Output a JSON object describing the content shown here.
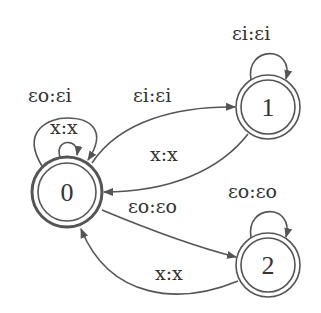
{
  "diagram": {
    "type": "finite-state-transducer",
    "colors": {
      "stroke": "#555555",
      "text": "#333333",
      "background": "#ffffff"
    },
    "nodes": [
      {
        "id": "0",
        "label": "0",
        "final": true,
        "initial": true
      },
      {
        "id": "1",
        "label": "1",
        "final": true
      },
      {
        "id": "2",
        "label": "2",
        "final": true
      }
    ],
    "edges": [
      {
        "from": "0",
        "to": "0",
        "label": "εo:εi"
      },
      {
        "from": "0",
        "to": "0",
        "label": "x:x"
      },
      {
        "from": "0",
        "to": "1",
        "label": "εi:εi"
      },
      {
        "from": "1",
        "to": "0",
        "label": "x:x"
      },
      {
        "from": "1",
        "to": "1",
        "label": "εi:εi"
      },
      {
        "from": "0",
        "to": "2",
        "label": "εo:εo"
      },
      {
        "from": "2",
        "to": "0",
        "label": "x:x"
      },
      {
        "from": "2",
        "to": "2",
        "label": "εo:εo"
      }
    ]
  }
}
